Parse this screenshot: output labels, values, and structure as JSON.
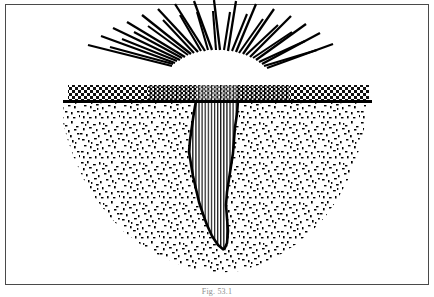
{
  "figure": {
    "caption": "Fig. 53.1",
    "colors": {
      "ink": "#000000",
      "frame": "#4a4a4a",
      "paper": "#ffffff",
      "caption_text": "#8d8d8d"
    },
    "frame": {
      "x": 5,
      "y": 4,
      "width": 424,
      "height": 281
    },
    "ground_line": {
      "x1": 63,
      "x2": 372,
      "y": 101,
      "thickness": 3
    },
    "surface_layer": {
      "label": "surfaced ground layer",
      "x": 68,
      "y": 85,
      "width": 301,
      "height": 16,
      "pattern_light": "checker-dot",
      "pattern_dense": "dense-checker",
      "dense_span": {
        "x1": 148,
        "x2": 290
      }
    },
    "fissure": {
      "label": "vertical fissure",
      "fill_pattern": "vertical-lines",
      "top_y": 101,
      "bottom_y": 250,
      "top_x1": 196,
      "top_x2": 238
    },
    "rock_mass": {
      "label": "stippled rock mass",
      "pattern": "random-stipple",
      "top_y": 101,
      "bottom_y": 280,
      "left_x": 63,
      "right_x": 372
    },
    "burst": {
      "label": "radiating burst lines",
      "center_x": 218,
      "center_y": 104,
      "inner_radius": 48,
      "ray_count": 29,
      "long_ray_length": 90,
      "short_ray_length": 64,
      "angle_start_deg": 188,
      "angle_end_deg": 352,
      "stroke_width": 2.2
    }
  }
}
